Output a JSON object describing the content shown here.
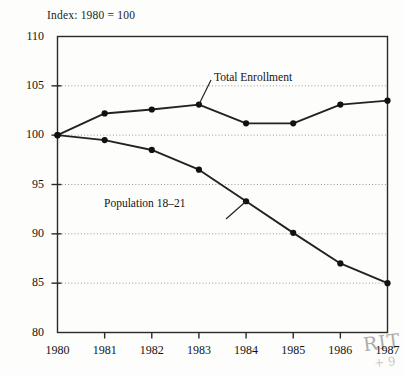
{
  "figure": {
    "index_note": "Index: 1980 = 100",
    "handwritten_mark": "RIT",
    "handwritten_submark": "+ 9"
  },
  "chart_data": {
    "type": "line",
    "title": "",
    "subtitle": "Index: 1980 = 100",
    "xlabel": "",
    "ylabel": "",
    "categories": [
      "1980",
      "1981",
      "1982",
      "1983",
      "1984",
      "1985",
      "1986",
      "1987"
    ],
    "x": [
      1980,
      1981,
      1982,
      1983,
      1984,
      1985,
      1986,
      1987
    ],
    "xlim": [
      1980,
      1987
    ],
    "ylim": [
      80,
      110
    ],
    "yticks": [
      80,
      85,
      90,
      95,
      100,
      105,
      110
    ],
    "ytick_labels": [
      "80",
      "85",
      "90",
      "95",
      "100",
      "105",
      "110"
    ],
    "grid": "horizontal-dotted",
    "legend": "inline-annotations",
    "marker": "filled-circle",
    "series": [
      {
        "name": "Total Enrollment",
        "values": [
          100.0,
          102.2,
          102.6,
          103.1,
          101.2,
          101.2,
          103.1,
          103.5
        ]
      },
      {
        "name": "Population 18–21",
        "values": [
          100.0,
          99.5,
          98.5,
          96.5,
          93.3,
          90.1,
          87.0,
          85.0
        ]
      }
    ],
    "annotations": [
      {
        "text": "Total Enrollment",
        "points_to_year": 1983,
        "points_to_value": 103.1
      },
      {
        "text": "Population 18–21",
        "points_to_year": 1984,
        "points_to_value": 93.3
      }
    ],
    "colors": {
      "line": "#222222",
      "marker": "#111111",
      "grid": "#9a9a9a",
      "frame": "#2a2a2a",
      "background": "#fdfdfc"
    }
  }
}
